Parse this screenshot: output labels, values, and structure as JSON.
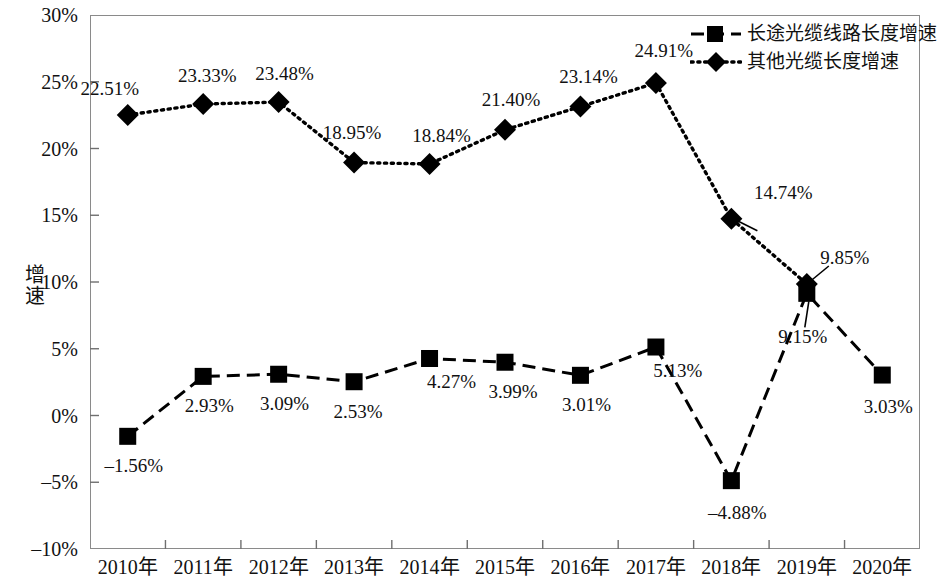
{
  "chart_data": {
    "type": "line",
    "title": "",
    "xlabel": "",
    "ylabel": "增速",
    "ylim": [
      -10,
      30
    ],
    "ytick_step": 5,
    "grid": false,
    "legend_position": "top-right",
    "categories": [
      "2010年",
      "2011年",
      "2012年",
      "2013年",
      "2014年",
      "2015年",
      "2016年",
      "2017年",
      "2018年",
      "2019年",
      "2020年"
    ],
    "ytick_labels": [
      "30%",
      "25%",
      "20%",
      "15%",
      "10%",
      "5%",
      "0%",
      "-5%",
      "-10%"
    ],
    "ytick_values": [
      30,
      25,
      20,
      15,
      10,
      5,
      0,
      -5,
      -10
    ],
    "series": [
      {
        "name": "长途光缆线路长度增速",
        "marker": "square",
        "line_style": "dashed",
        "color": "#000000",
        "values": [
          -1.56,
          2.93,
          3.09,
          2.53,
          4.27,
          3.99,
          3.01,
          5.13,
          -4.88,
          9.15,
          3.03
        ],
        "labels": [
          "-1.56%",
          "2.93%",
          "3.09%",
          "2.53%",
          "4.27%",
          "3.99%",
          "3.01%",
          "5.13%",
          "-4.88%",
          "9.15%",
          "3.03%"
        ]
      },
      {
        "name": "其他光缆长度增速",
        "marker": "diamond",
        "line_style": "dotted",
        "color": "#000000",
        "values": [
          22.51,
          23.33,
          23.48,
          18.95,
          18.84,
          21.4,
          23.14,
          24.91,
          14.74,
          9.85,
          null
        ],
        "labels": [
          "22.51%",
          "23.33%",
          "23.48%",
          "18.95%",
          "18.84%",
          "21.40%",
          "23.14%",
          "24.91%",
          "14.74%",
          "9.85%",
          ""
        ]
      }
    ]
  },
  "legend": {
    "items": [
      {
        "label": "长途光缆线路长度增速",
        "marker": "square",
        "line_style": "dashed"
      },
      {
        "label": "其他光缆长度增速",
        "marker": "diamond",
        "line_style": "dotted"
      }
    ]
  }
}
